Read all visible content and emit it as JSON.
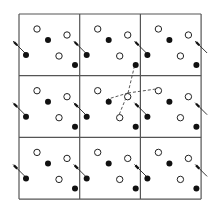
{
  "diagram": {
    "type": "periodic-lattice",
    "grid": {
      "rows": 3,
      "cols": 3,
      "origin": [
        19,
        14
      ],
      "cell_size": [
        60.7,
        61.7
      ],
      "line_color": "#555555"
    },
    "unit_cell": {
      "open_circles": [
        [
          18,
          15
        ],
        [
          48,
          21
        ],
        [
          40,
          42
        ]
      ],
      "filled_circles": [
        [
          29,
          26
        ],
        [
          7,
          41
        ],
        [
          56,
          51
        ]
      ],
      "arrow": {
        "from": [
          -6,
          27
        ],
        "to": [
          6,
          39
        ]
      }
    },
    "connections": {
      "hub": [
        128,
        93
      ],
      "neighbors": [
        [
          135,
          64
        ],
        [
          108,
          99
        ],
        [
          156,
          89
        ],
        [
          119,
          115
        ]
      ],
      "style": "dashed"
    },
    "colors": {
      "open_fill": "#ffffff",
      "stroke": "#222222",
      "filled": "#111111"
    }
  }
}
